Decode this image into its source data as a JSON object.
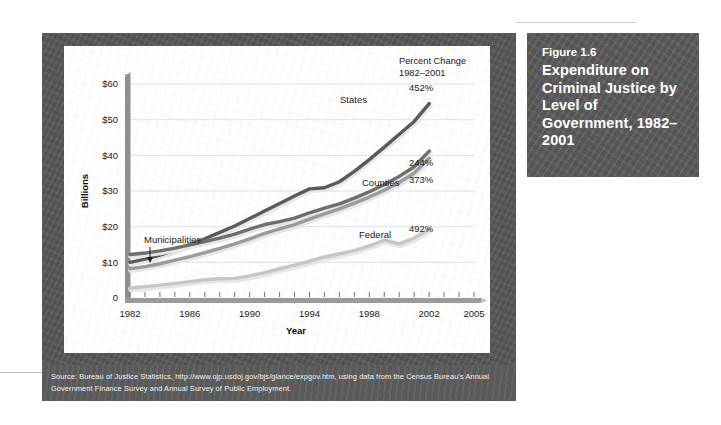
{
  "figure": {
    "number": "Figure 1.6",
    "title": "Expenditure on Criminal Justice by Level of Government, 1982–2001"
  },
  "source": {
    "text": "Source: Bureau of Justice Statistics, http://www.ojp.usdoj.gov/bjs/glance/expgov.htm, using data from the Census Bureau's Annual Government Finance Survey and Annual Survey of Public Employment."
  },
  "annotations": {
    "header_line1": "Percent Change",
    "header_line2": "1982–2001",
    "municipalities_callout": "Municipalities"
  },
  "colors": {
    "frame": "#575757",
    "title_block": "#5b5b5b",
    "source_bar": "#5d5d5d",
    "plot_bg": "#ffffff",
    "gridline": "#dcdcdc",
    "axis": "#8a8a8a",
    "states": "#5a5a5a",
    "municipalities": "#6e6e6e",
    "counties": "#9b9b9b",
    "federal": "#c6c6c6"
  },
  "chart_data": {
    "type": "line",
    "title": "Expenditure on Criminal Justice by Level of Government, 1982–2001",
    "xlabel": "Year",
    "ylabel": "Billions",
    "xlim": [
      1982,
      2005
    ],
    "ylim": [
      0,
      60
    ],
    "xticks": [
      1982,
      1986,
      1990,
      1994,
      1998,
      2002,
      2005
    ],
    "xtick_labels": [
      "1982",
      "1986",
      "1990",
      "1994",
      "1998",
      "2002",
      "2005"
    ],
    "minor_xticks_every": 1,
    "yticks": [
      0,
      10,
      20,
      30,
      40,
      50,
      60
    ],
    "ytick_labels": [
      "0",
      "$10",
      "$20",
      "$30",
      "$40",
      "$50",
      "$60"
    ],
    "grid": "horizontal",
    "legend": "inline-labels",
    "x": [
      1982,
      1983,
      1984,
      1985,
      1986,
      1987,
      1988,
      1989,
      1990,
      1991,
      1992,
      1993,
      1994,
      1995,
      1996,
      1997,
      1998,
      1999,
      2000,
      2001,
      2002
    ],
    "series": [
      {
        "name": "States",
        "label": "States",
        "percent_change": "452%",
        "color": "#5a5a5a",
        "values": [
          10.0,
          10.9,
          12.0,
          13.4,
          15.0,
          16.6,
          18.4,
          20.2,
          22.3,
          24.4,
          26.5,
          28.6,
          30.6,
          30.9,
          32.6,
          35.5,
          38.8,
          42.3,
          45.9,
          49.5,
          54.5
        ]
      },
      {
        "name": "Municipalities",
        "label": "Municipalities",
        "percent_change": "244%",
        "color": "#6e6e6e",
        "values": [
          12.2,
          12.6,
          13.2,
          14.0,
          14.9,
          15.8,
          16.8,
          17.9,
          19.3,
          20.6,
          21.4,
          22.4,
          23.9,
          25.2,
          26.4,
          28.0,
          29.8,
          31.8,
          34.1,
          36.8,
          41.2
        ]
      },
      {
        "name": "Counties",
        "label": "Counties",
        "percent_change": "373%",
        "color": "#9b9b9b",
        "values": [
          8.2,
          8.8,
          9.6,
          10.6,
          11.6,
          12.7,
          13.9,
          15.2,
          16.6,
          18.1,
          19.4,
          20.6,
          22.1,
          23.6,
          25.0,
          26.6,
          28.3,
          30.2,
          32.4,
          35.0,
          39.2
        ]
      },
      {
        "name": "Federal",
        "label": "Federal",
        "percent_change": "492%",
        "color": "#c6c6c6",
        "values": [
          2.8,
          3.2,
          3.6,
          4.1,
          4.6,
          5.1,
          5.4,
          5.5,
          6.2,
          7.1,
          8.2,
          9.2,
          10.3,
          11.5,
          12.4,
          13.3,
          14.6,
          16.2,
          15.2,
          16.8,
          19.3
        ]
      }
    ]
  }
}
